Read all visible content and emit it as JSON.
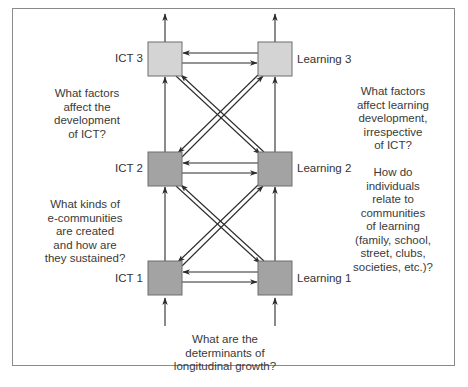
{
  "nodes": {
    "ict3": {
      "label": "ICT 3",
      "fill": "#d4d4d4"
    },
    "ict2": {
      "label": "ICT 2",
      "fill": "#a3a3a3"
    },
    "ict1": {
      "label": "ICT 1",
      "fill": "#a3a3a3"
    },
    "learning3": {
      "label": "Learning 3",
      "fill": "#d4d4d4"
    },
    "learning2": {
      "label": "Learning 2",
      "fill": "#a3a3a3"
    },
    "learning1": {
      "label": "Learning 1",
      "fill": "#a3a3a3"
    }
  },
  "questions": {
    "ict_development": "What factors\naffect the\ndevelopment\nof ICT?",
    "e_communities": "What kinds of\ne-communities\nare created\nand how are\nthey sustained?",
    "learning_development": "What factors\naffect learning\ndevelopment,\nirrespective\nof ICT?",
    "communities_of_learning": "How do\nindividuals\nrelate to\ncommunities\nof learning\n(family, school,\nstreet, clubs,\nsocieties, etc.)?",
    "longitudinal_growth": "What are the\ndeterminants of\nlongitudinal growth?"
  },
  "edges": [
    {
      "from": "ict1",
      "to": "ict2"
    },
    {
      "from": "ict2",
      "to": "ict3"
    },
    {
      "from": "learning1",
      "to": "learning2"
    },
    {
      "from": "learning2",
      "to": "learning3"
    },
    {
      "from": "ict1",
      "to": "learning1"
    },
    {
      "from": "learning1",
      "to": "ict1"
    },
    {
      "from": "ict2",
      "to": "learning2"
    },
    {
      "from": "learning2",
      "to": "ict2"
    },
    {
      "from": "ict3",
      "to": "learning3"
    },
    {
      "from": "learning3",
      "to": "ict3"
    },
    {
      "from": "ict1",
      "to": "learning2"
    },
    {
      "from": "learning2",
      "to": "ict1"
    },
    {
      "from": "learning1",
      "to": "ict2"
    },
    {
      "from": "ict2",
      "to": "learning1"
    },
    {
      "from": "ict2",
      "to": "learning3"
    },
    {
      "from": "learning3",
      "to": "ict2"
    },
    {
      "from": "learning2",
      "to": "ict3"
    },
    {
      "from": "ict3",
      "to": "learning2"
    }
  ],
  "colors": {
    "line": "#2b2b2b",
    "box_border": "#6e6e6e",
    "frame": "#8a8a8a"
  }
}
